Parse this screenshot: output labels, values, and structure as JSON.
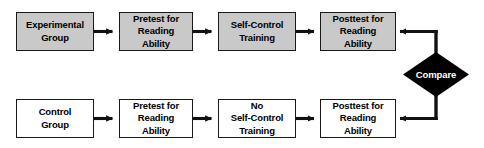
{
  "diagram": {
    "type": "flowchart",
    "background_color": "#ffffff",
    "line_color": "#1a1a1a",
    "shaded_fill": "#c9c9c9",
    "plain_fill": "#ffffff",
    "diamond_fill": "#000000",
    "diamond_text_color": "#ffffff",
    "rows": [
      {
        "id": "experimental-row",
        "name": "Experimental Group Row",
        "shaded": true,
        "nodes": [
          {
            "id": "experimental-group",
            "label": "Experimental\nGroup"
          },
          {
            "id": "pretest-experimental",
            "label": "Pretest for\nReading\nAbility"
          },
          {
            "id": "self-control-training",
            "label": "Self-Control\nTraining"
          },
          {
            "id": "posttest-experimental",
            "label": "Posttest for\nReading\nAbility"
          }
        ]
      },
      {
        "id": "control-row",
        "name": "Control Group Row",
        "shaded": false,
        "nodes": [
          {
            "id": "control-group",
            "label": "Control\nGroup"
          },
          {
            "id": "pretest-control",
            "label": "Pretest for\nReading\nAbility"
          },
          {
            "id": "no-self-control-training",
            "label": "No\nSelf-Control\nTraining"
          },
          {
            "id": "posttest-control",
            "label": "Posttest for\nReading\nAbility"
          }
        ]
      }
    ],
    "decision": {
      "id": "compare-decision",
      "label": "Compare"
    },
    "connectors": [
      {
        "id": "arrow-exp-1",
        "from": "experimental-group",
        "to": "pretest-experimental",
        "direction": "right"
      },
      {
        "id": "arrow-exp-2",
        "from": "pretest-experimental",
        "to": "self-control-training",
        "direction": "right"
      },
      {
        "id": "arrow-exp-3",
        "from": "self-control-training",
        "to": "posttest-experimental",
        "direction": "right"
      },
      {
        "id": "arrow-ctl-1",
        "from": "control-group",
        "to": "pretest-control",
        "direction": "right"
      },
      {
        "id": "arrow-ctl-2",
        "from": "pretest-control",
        "to": "no-self-control-training",
        "direction": "right"
      },
      {
        "id": "arrow-ctl-3",
        "from": "no-self-control-training",
        "to": "posttest-control",
        "direction": "right"
      },
      {
        "id": "arrow-compare-top",
        "from": "compare-decision",
        "to": "posttest-experimental",
        "direction": "left"
      },
      {
        "id": "arrow-compare-bottom",
        "from": "compare-decision",
        "to": "posttest-control",
        "direction": "left"
      }
    ]
  }
}
